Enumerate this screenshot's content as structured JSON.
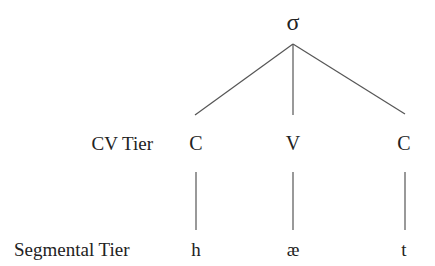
{
  "diagram": {
    "root": {
      "label": "σ",
      "x": 293,
      "y": 44
    },
    "tiers": [
      {
        "name": "CV Tier",
        "y": 150
      },
      {
        "name": "Segmental Tier",
        "y": 256
      }
    ],
    "columns": [
      {
        "cv": "C",
        "segment": "h",
        "x": 196
      },
      {
        "cv": "V",
        "segment": "æ",
        "x": 293
      },
      {
        "cv": "C",
        "segment": "t",
        "x": 404
      }
    ],
    "line_color": "#555555",
    "text_color": "#222222"
  }
}
